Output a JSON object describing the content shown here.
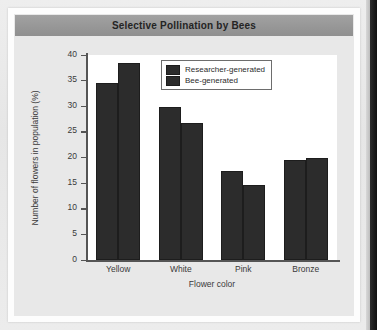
{
  "figure": {
    "title": "Selective Pollination by Bees"
  },
  "chart_data": {
    "type": "bar",
    "title": "Selective Pollination by Bees",
    "xlabel": "Flower color",
    "ylabel": "Number of flowers in population (%)",
    "categories": [
      "Yellow",
      "White",
      "Pink",
      "Bronze"
    ],
    "series": [
      {
        "name": "Researcher-generated",
        "color": "#2c2c2c",
        "values": [
          34.5,
          29.8,
          17.4,
          19.5
        ]
      },
      {
        "name": "Bee-generated",
        "color": "#2c2c2c",
        "values": [
          38.5,
          26.7,
          14.7,
          19.9
        ]
      }
    ],
    "ylim": [
      0,
      40
    ],
    "yticks": [
      0,
      5,
      10,
      15,
      20,
      25,
      30,
      35,
      40
    ],
    "ytick_labels": [
      "0",
      "5",
      "10",
      "15",
      "20",
      "25",
      "30",
      "35",
      "40"
    ],
    "grid": false,
    "legend_position": "top-right"
  },
  "colors": {
    "bar": "#2c2c2c",
    "title_band": "#989898",
    "plot_background": "#ffffff",
    "figure_background": "#e8e8e8",
    "axis": "#555555",
    "text": "#3a3a3a"
  }
}
